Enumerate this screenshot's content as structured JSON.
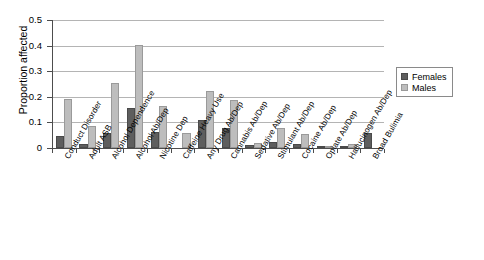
{
  "chart_data": {
    "type": "bar",
    "title": "",
    "xlabel": "",
    "ylabel": "Proportion affected",
    "ylim": [
      0,
      0.5
    ],
    "ytick_labels": [
      "0",
      "0.1",
      "0.2",
      "0.3",
      "0.4",
      "0.5"
    ],
    "ytick_values": [
      0,
      0.1,
      0.2,
      0.3,
      0.4,
      0.5
    ],
    "grid": "horizontal",
    "legend_position": "upper-right",
    "categories": [
      "Conduct Disorder",
      "Adult ASB",
      "Alcohol Dependence",
      "Alcohol Ab/Dep",
      "Nicotine Dep",
      "Caffeine Heavy Use",
      "Any Drug Ab/Dep",
      "Cannabis Ab/Dep",
      "Sedative Ab/Dep",
      "Stimulant Ab/Dep",
      "Cocaine Ab/Dep",
      "Opiate Ab/Dep",
      "Hallucinogen Ab/Dep",
      "Broad Bulimia"
    ],
    "series": [
      {
        "name": "Females",
        "color": "#5e5e5e",
        "values": [
          0.045,
          0.017,
          0.057,
          0.155,
          0.062,
          0.0,
          0.11,
          0.078,
          0.01,
          0.022,
          0.017,
          0.004,
          0.008,
          0.057
        ]
      },
      {
        "name": "Males",
        "color": "#bdbdbd",
        "values": [
          0.193,
          0.085,
          0.255,
          0.402,
          0.165,
          0.057,
          0.222,
          0.188,
          0.019,
          0.078,
          0.054,
          0.006,
          0.017,
          0.0
        ]
      }
    ]
  },
  "legend": {
    "items": [
      {
        "label": "Females",
        "key": "f"
      },
      {
        "label": "Males",
        "key": "m"
      }
    ]
  }
}
